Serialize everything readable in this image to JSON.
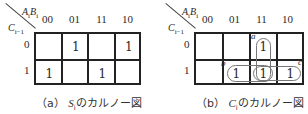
{
  "col_headers": [
    "00",
    "01",
    "11",
    "10"
  ],
  "row_headers": [
    "0",
    "1"
  ],
  "col_var_label": {
    "a": "A",
    "a_sub": "i",
    "b": "B",
    "b_sub": "i"
  },
  "row_var_label": {
    "c": "C",
    "c_sub": "i−1"
  },
  "maps": [
    {
      "id": "a",
      "caption_prefix": "（a）",
      "caption_var": "S",
      "caption_sub": "i",
      "caption_suffix": "のカルノー図",
      "cells": [
        [
          "",
          "1",
          "",
          "1"
        ],
        [
          "1",
          "",
          "1",
          ""
        ]
      ]
    },
    {
      "id": "b",
      "caption_prefix": "（b）",
      "caption_var": "C",
      "caption_sub": "i",
      "caption_suffix": "のカルノー図",
      "cells": [
        [
          "",
          "",
          "1",
          ""
        ],
        [
          "",
          "1",
          "1",
          "1"
        ]
      ],
      "loops": [
        {
          "label": "a",
          "cells": "col 11, rows 0-1"
        },
        {
          "label": "b",
          "cells": "row 1, cols 01-11"
        },
        {
          "label": "c",
          "cells": "row 1, cols 11-10"
        }
      ]
    }
  ]
}
